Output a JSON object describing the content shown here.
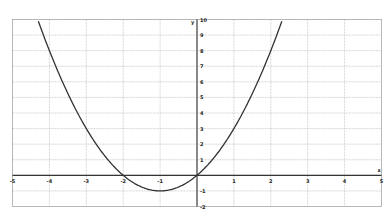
{
  "chart_data": {
    "type": "line",
    "title": "",
    "xlabel": "x",
    "ylabel": "y",
    "function": "y = x^2 + 2x",
    "xlim": [
      -5,
      5
    ],
    "ylim": [
      -2,
      10
    ],
    "grid": true,
    "x_ticks": [
      -5,
      -4,
      -3,
      -2,
      -1,
      1,
      2,
      3,
      4,
      5
    ],
    "y_ticks": [
      10,
      9,
      8,
      7,
      6,
      5,
      4,
      3,
      2,
      1,
      -1,
      -2
    ],
    "series": [
      {
        "name": "parabola",
        "color": "#333333",
        "x": [
          -4.32,
          -4,
          -3.5,
          -3,
          -2.5,
          -2,
          -1.5,
          -1,
          -0.5,
          0,
          0.5,
          1,
          1.5,
          2,
          2.32
        ],
        "y": [
          10,
          8,
          5.25,
          3,
          1.25,
          0,
          -0.75,
          -1,
          -0.75,
          0,
          1.25,
          3,
          5.25,
          8,
          10
        ]
      }
    ],
    "key_points": {
      "vertex": [
        -1,
        -1
      ],
      "roots": [
        -2,
        0
      ]
    }
  },
  "colors": {
    "axis": "#333333",
    "grid": "#bbbbbb",
    "curve": "#333333",
    "frame": "#999999"
  }
}
